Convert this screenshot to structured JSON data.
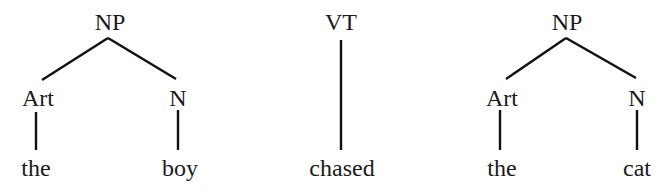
{
  "diagram": {
    "type": "syntax-tree-fragments",
    "trees": [
      {
        "id": "np1",
        "root": "NP",
        "root_pos": {
          "x": 110,
          "y": 10
        },
        "apex": {
          "x": 108,
          "y": 38
        },
        "children": [
          {
            "label": "Art",
            "pos": {
              "x": 38,
              "y": 86
            },
            "edge_end": {
              "x": 42,
              "y": 80
            },
            "leaf": "the",
            "leaf_pos": {
              "x": 36,
              "y": 156
            },
            "stem": {
              "x": 36,
              "y1": 112,
              "y2": 150
            }
          },
          {
            "label": "N",
            "pos": {
              "x": 178,
              "y": 86
            },
            "edge_end": {
              "x": 176,
              "y": 79
            },
            "leaf": "boy",
            "leaf_pos": {
              "x": 180,
              "y": 156
            },
            "stem": {
              "x": 178,
              "y1": 110,
              "y2": 150
            }
          }
        ]
      },
      {
        "id": "vt",
        "root": "VT",
        "root_pos": {
          "x": 341,
          "y": 10
        },
        "stem": {
          "x": 341,
          "y1": 40,
          "y2": 150
        },
        "leaf": "chased",
        "leaf_pos": {
          "x": 342,
          "y": 156
        }
      },
      {
        "id": "np2",
        "root": "NP",
        "root_pos": {
          "x": 567,
          "y": 10
        },
        "apex": {
          "x": 566,
          "y": 38
        },
        "children": [
          {
            "label": "Art",
            "pos": {
              "x": 502,
              "y": 86
            },
            "edge_end": {
              "x": 506,
              "y": 79
            },
            "leaf": "the",
            "leaf_pos": {
              "x": 502,
              "y": 156
            },
            "stem": {
              "x": 500,
              "y1": 110,
              "y2": 150
            }
          },
          {
            "label": "N",
            "pos": {
              "x": 637,
              "y": 86
            },
            "edge_end": {
              "x": 636,
              "y": 78
            },
            "leaf": "cat",
            "leaf_pos": {
              "x": 637,
              "y": 156
            },
            "stem": {
              "x": 637,
              "y1": 110,
              "y2": 150
            }
          }
        ]
      }
    ]
  },
  "labels": {
    "np1_root": "NP",
    "np1_art": "Art",
    "np1_n": "N",
    "np1_the": "the",
    "np1_boy": "boy",
    "vt_root": "VT",
    "vt_leaf": "chased",
    "np2_root": "NP",
    "np2_art": "Art",
    "np2_n": "N",
    "np2_the": "the",
    "np2_cat": "cat"
  },
  "colors": {
    "ink": "#111111",
    "background": "#ffffff"
  }
}
